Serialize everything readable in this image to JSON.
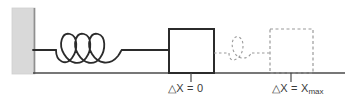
{
  "diagram": {
    "colors": {
      "line": "#2b2b2b",
      "wall_fill": "#d8d8d8",
      "wall_edge": "#8c8c8c",
      "ghost": "#9a9a9a",
      "ground": "#4a4a4a",
      "text": "#3a3a3a",
      "background": "#ffffff"
    },
    "wall": {
      "name": "wall",
      "x": 12,
      "y": 8,
      "width": 23,
      "height": 66
    },
    "ground": {
      "name": "ground-line",
      "x1": 33,
      "y1": 73,
      "x2": 345,
      "y2": 73
    },
    "spring": {
      "name": "spring-coil",
      "coils": 3,
      "start_x": 33,
      "coil_start_x": 58,
      "coil_end_x": 122,
      "end_x": 169,
      "center_y": 50,
      "amplitude": 16,
      "state": "relaxed"
    },
    "ghost_spring": {
      "name": "ghost-spring-coil",
      "coils": 1,
      "start_x": 214,
      "coil_start_x": 230,
      "coil_end_x": 250,
      "end_x": 272,
      "center_y": 53,
      "amplitude": 13,
      "state": "stretched"
    },
    "block_solid": {
      "name": "block-at-equilibrium",
      "x": 169,
      "y": 29,
      "width": 45,
      "height": 44,
      "style": "solid"
    },
    "block_ghost": {
      "name": "block-at-max-displacement",
      "x": 270,
      "y": 29,
      "width": 43,
      "height": 44,
      "style": "dashed"
    },
    "ticks": [
      {
        "name": "tick-equilibrium",
        "x": 191,
        "y_top": 73,
        "y_bottom": 82
      },
      {
        "name": "tick-max",
        "x": 291,
        "y_top": 73,
        "y_bottom": 82
      }
    ]
  },
  "labels": {
    "equilibrium": {
      "delta": "△",
      "variable": "X",
      "equals": " = ",
      "value": "0",
      "full_text": "△X = 0"
    },
    "max_stretch": {
      "delta": "△",
      "variable": "X",
      "equals": " = ",
      "value": "X",
      "subscript": "max",
      "full_text": "△X = Xmax"
    }
  }
}
